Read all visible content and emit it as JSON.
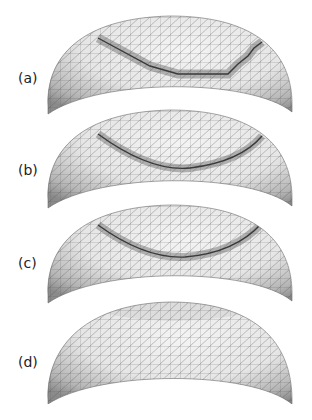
{
  "figure": {
    "panels": [
      {
        "id": "a",
        "label": "(a)",
        "top": 8,
        "label_y": 62,
        "band": "stepped",
        "band_path": "M98 30 L150 58 L178 66 L228 66 L238 56 L248 48 L254 40 L262 34",
        "desc": "mesh dome with stepped dark band along staircase-shaped cut"
      },
      {
        "id": "b",
        "label": "(b)",
        "top": 102,
        "label_y": 60,
        "band": "curve",
        "band_path": "M98 32 Q150 70 190 66 Q240 60 262 34",
        "desc": "mesh dome with smooth curved cut line and jagged dark band"
      },
      {
        "id": "c",
        "label": "(c)",
        "top": 197,
        "label_y": 58,
        "band": "curve",
        "band_path": "M98 28 Q145 62 185 60 Q235 56 262 26",
        "desc": "mesh dome with smooth curved cut line and refined band"
      },
      {
        "id": "d",
        "label": "(d)",
        "top": 292,
        "label_y": 62,
        "band": "none",
        "band_path": "",
        "desc": "remeshed dome with adapted triangles, no band"
      }
    ],
    "colors": {
      "mesh_fill_light": "#e6e6e6",
      "mesh_fill_dark": "#8a8a8a",
      "mesh_line": "#555555",
      "band": "#7d7d7d",
      "cut_line": "#3a3a3a",
      "background": "#ffffff"
    }
  }
}
